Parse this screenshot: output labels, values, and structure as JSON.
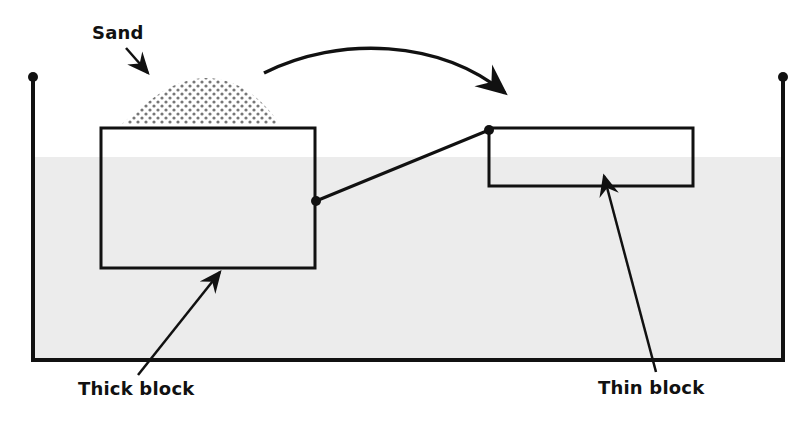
{
  "diagram": {
    "labels": {
      "sand": "Sand",
      "thick_block": "Thick block",
      "thin_block": "Thin block"
    },
    "colors": {
      "stroke": "#111111",
      "water": "#ececec",
      "sand_dots": "#777777",
      "background": "#ffffff"
    }
  }
}
